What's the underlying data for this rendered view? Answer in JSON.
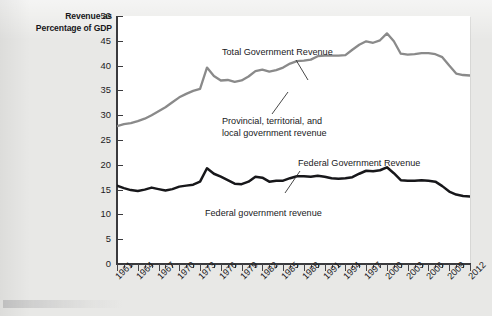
{
  "axis_title": {
    "line1": "Revenue as",
    "line2": "Percentage of GDP"
  },
  "annotations": {
    "total": "Total Government Revenue",
    "provincial_line1": "Provincial, territorial, and",
    "provincial_line2": "local government revenue",
    "federal_upper": "Federal Government Revenue",
    "federal_lower": "Federal government revenue"
  },
  "colors": {
    "total_line": "#8a8a8a",
    "federal_line": "#17171a",
    "axis": "#3a3a3d",
    "plot_background": "#ffffff",
    "page_background": "#e8e8e6"
  },
  "chart_data": {
    "type": "line",
    "title": "",
    "xlabel": "",
    "ylabel": "Revenue as Percentage of GDP",
    "xlim": [
      1961,
      2012
    ],
    "ylim": [
      0,
      50
    ],
    "yticks": [
      0,
      5,
      10,
      15,
      20,
      25,
      30,
      35,
      40,
      45,
      50
    ],
    "xticks_labeled": [
      1961,
      1964,
      1967,
      1970,
      1973,
      1976,
      1979,
      1982,
      1985,
      1988,
      1991,
      1994,
      1997,
      2000,
      2003,
      2006,
      2009,
      2012
    ],
    "grid": false,
    "legend": "annotations on plot",
    "x": [
      1961,
      1962,
      1963,
      1964,
      1965,
      1966,
      1967,
      1968,
      1969,
      1970,
      1971,
      1972,
      1973,
      1974,
      1975,
      1976,
      1977,
      1978,
      1979,
      1980,
      1981,
      1982,
      1983,
      1984,
      1985,
      1986,
      1987,
      1988,
      1989,
      1990,
      1991,
      1992,
      1993,
      1994,
      1995,
      1996,
      1997,
      1998,
      1999,
      2000,
      2001,
      2002,
      2003,
      2004,
      2005,
      2006,
      2007,
      2008,
      2009,
      2010,
      2011,
      2012
    ],
    "series": [
      {
        "name": "Total Government Revenue",
        "color": "#8a8a8a",
        "values": [
          27.8,
          28.2,
          28.4,
          28.8,
          29.3,
          30.0,
          30.8,
          31.6,
          32.6,
          33.6,
          34.3,
          34.9,
          35.3,
          39.6,
          37.9,
          37.0,
          37.1,
          36.7,
          37.0,
          37.8,
          38.9,
          39.2,
          38.8,
          39.1,
          39.6,
          40.4,
          40.9,
          41.0,
          41.2,
          41.9,
          42.0,
          42.0,
          42.0,
          42.1,
          43.2,
          44.2,
          44.9,
          44.6,
          45.1,
          46.5,
          44.9,
          42.4,
          42.2,
          42.3,
          42.5,
          42.5,
          42.3,
          41.7,
          40.0,
          38.4,
          38.1,
          38.0
        ]
      },
      {
        "name": "Federal government revenue",
        "color": "#17171a",
        "values": [
          15.8,
          15.3,
          14.9,
          14.7,
          15.0,
          15.4,
          15.1,
          14.8,
          15.1,
          15.6,
          15.8,
          16.0,
          16.6,
          19.3,
          18.2,
          17.6,
          16.9,
          16.2,
          16.1,
          16.6,
          17.6,
          17.4,
          16.6,
          16.8,
          16.8,
          17.3,
          17.7,
          17.7,
          17.6,
          17.8,
          17.6,
          17.3,
          17.2,
          17.3,
          17.5,
          18.2,
          18.8,
          18.7,
          18.9,
          19.5,
          18.3,
          16.9,
          16.8,
          16.8,
          16.9,
          16.8,
          16.6,
          15.7,
          14.6,
          14.0,
          13.7,
          13.6
        ]
      }
    ]
  }
}
